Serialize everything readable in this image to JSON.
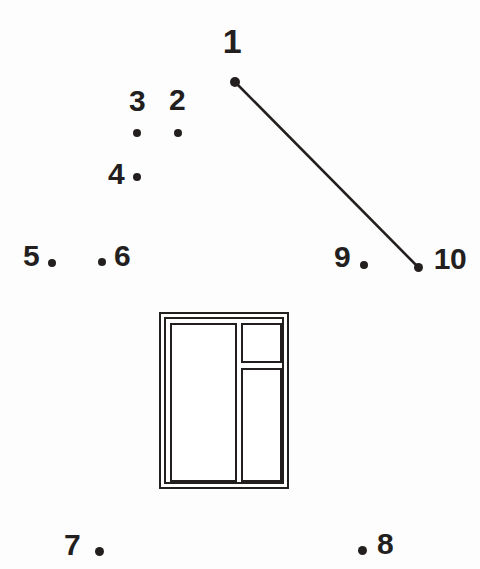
{
  "figure": {
    "kind": "dot-numbering-diagram",
    "background_color": "#fdfdfd",
    "ink_color": "#231f1e",
    "width": 480,
    "height": 569
  },
  "points": [
    {
      "id": "1",
      "label": "1",
      "label_x": 232,
      "label_y": 41,
      "dot_x": 235,
      "dot_y": 82,
      "dot_r": 5.0,
      "font_size": 34
    },
    {
      "id": "2",
      "label": "2",
      "label_x": 177,
      "label_y": 100,
      "dot_x": 178,
      "dot_y": 133,
      "dot_r": 4.0,
      "font_size": 30
    },
    {
      "id": "3",
      "label": "3",
      "label_x": 137,
      "label_y": 101,
      "dot_x": 137,
      "dot_y": 133,
      "dot_r": 4.0,
      "font_size": 30
    },
    {
      "id": "4",
      "label": "4",
      "label_x": 116,
      "label_y": 174,
      "dot_x": 137,
      "dot_y": 177,
      "dot_r": 4.0,
      "font_size": 30
    },
    {
      "id": "5",
      "label": "5",
      "label_x": 31,
      "label_y": 256,
      "dot_x": 52,
      "dot_y": 263,
      "dot_r": 4.0,
      "font_size": 30
    },
    {
      "id": "6",
      "label": "6",
      "label_x": 122,
      "label_y": 256,
      "dot_x": 102,
      "dot_y": 262,
      "dot_r": 4.0,
      "font_size": 30
    },
    {
      "id": "7",
      "label": "7",
      "label_x": 72,
      "label_y": 545,
      "dot_x": 99,
      "dot_y": 551,
      "dot_r": 4.5,
      "font_size": 30
    },
    {
      "id": "8",
      "label": "8",
      "label_x": 385,
      "label_y": 544,
      "dot_x": 362,
      "dot_y": 550,
      "dot_r": 4.5,
      "font_size": 30
    },
    {
      "id": "9",
      "label": "9",
      "label_x": 342,
      "label_y": 257,
      "dot_x": 364,
      "dot_y": 265,
      "dot_r": 4.0,
      "font_size": 30
    },
    {
      "id": "10",
      "label": "10",
      "label_x": 450,
      "label_y": 259,
      "dot_x": 418,
      "dot_y": 267,
      "dot_r": 4.5,
      "font_size": 30
    }
  ],
  "connector": {
    "from_point": "1",
    "to_point": "10",
    "x1": 235,
    "y1": 82,
    "x2": 418,
    "y2": 267,
    "stroke_width": 2.6,
    "color": "#231f1e"
  },
  "window_object": {
    "name": "window-frame",
    "outer": {
      "x": 159,
      "y": 312,
      "w": 130,
      "h": 177
    },
    "inner_border": {
      "x": 164,
      "y": 317,
      "w": 120,
      "h": 167
    },
    "panes": [
      {
        "name": "pane-left-tall",
        "x": 168,
        "y": 321,
        "w": 67,
        "h": 159
      },
      {
        "name": "pane-right-top",
        "x": 239,
        "y": 321,
        "w": 41,
        "h": 40
      },
      {
        "name": "pane-right-tall",
        "x": 239,
        "y": 366,
        "w": 41,
        "h": 114
      }
    ]
  }
}
